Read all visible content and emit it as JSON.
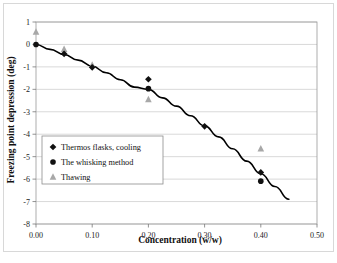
{
  "chart_data": {
    "type": "scatter",
    "title": "",
    "xlabel": "Concentration (w/w)",
    "ylabel": "Freezing point depression (deg)",
    "xlim": [
      0.0,
      0.5
    ],
    "ylim": [
      -8,
      1
    ],
    "xticks": [
      "0.00",
      "0.10",
      "0.20",
      "0.30",
      "0.40",
      "0.50"
    ],
    "xtick_values": [
      0.0,
      0.1,
      0.2,
      0.3,
      0.4,
      0.5
    ],
    "yticks": [
      "1",
      "0",
      "-1",
      "-2",
      "-3",
      "-4",
      "-5",
      "-6",
      "-7",
      "-8"
    ],
    "ytick_values": [
      1,
      0,
      -1,
      -2,
      -3,
      -4,
      -5,
      -6,
      -7,
      -8
    ],
    "grid": "horizontal",
    "legend_position": "center-left",
    "series": [
      {
        "name": "Thermos flasks, cooling",
        "marker": "diamond",
        "color": "#111111",
        "points": [
          {
            "x": 0.05,
            "y": -0.42
          },
          {
            "x": 0.1,
            "y": -1.02
          },
          {
            "x": 0.2,
            "y": -1.55
          },
          {
            "x": 0.3,
            "y": -3.65
          },
          {
            "x": 0.4,
            "y": -5.7
          }
        ]
      },
      {
        "name": "The whisking method",
        "marker": "circle",
        "color": "#111111",
        "points": [
          {
            "x": 0.0,
            "y": 0.0
          },
          {
            "x": 0.2,
            "y": -1.97
          },
          {
            "x": 0.4,
            "y": -6.09
          }
        ]
      },
      {
        "name": "Thawing",
        "marker": "triangle",
        "color": "#a8a8a8",
        "points": [
          {
            "x": 0.0,
            "y": 0.55
          },
          {
            "x": 0.05,
            "y": -0.22
          },
          {
            "x": 0.1,
            "y": -0.92
          },
          {
            "x": 0.2,
            "y": -2.45
          },
          {
            "x": 0.4,
            "y": -4.65
          }
        ]
      }
    ],
    "fit_curve": {
      "name": "fitted trend line",
      "color": "#000000",
      "points": [
        {
          "x": 0.0,
          "y": 0.0
        },
        {
          "x": 0.025,
          "y": -0.22
        },
        {
          "x": 0.05,
          "y": -0.45
        },
        {
          "x": 0.075,
          "y": -0.7
        },
        {
          "x": 0.1,
          "y": -0.97
        },
        {
          "x": 0.125,
          "y": -1.26
        },
        {
          "x": 0.15,
          "y": -1.57
        },
        {
          "x": 0.175,
          "y": -1.9
        },
        {
          "x": 0.2,
          "y": -2.0
        },
        {
          "x": 0.225,
          "y": -2.38
        },
        {
          "x": 0.25,
          "y": -2.75
        },
        {
          "x": 0.275,
          "y": -3.18
        },
        {
          "x": 0.3,
          "y": -3.63
        },
        {
          "x": 0.325,
          "y": -4.12
        },
        {
          "x": 0.35,
          "y": -4.65
        },
        {
          "x": 0.375,
          "y": -5.2
        },
        {
          "x": 0.4,
          "y": -5.76
        },
        {
          "x": 0.425,
          "y": -6.33
        },
        {
          "x": 0.45,
          "y": -6.9
        }
      ]
    },
    "legend_entries": [
      {
        "label": "Thermos flasks, cooling",
        "marker": "diamond",
        "color": "#111111"
      },
      {
        "label": "The whisking method",
        "marker": "circle",
        "color": "#111111"
      },
      {
        "label": "Thawing",
        "marker": "triangle",
        "color": "#a8a8a8"
      }
    ]
  }
}
